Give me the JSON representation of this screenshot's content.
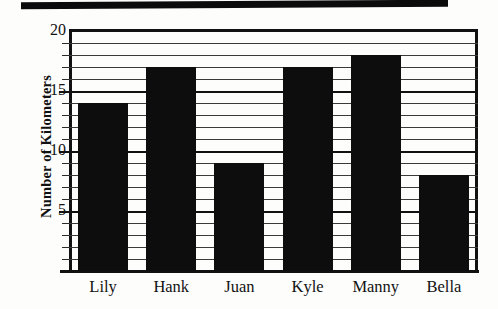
{
  "chart_data": {
    "type": "bar",
    "title": "",
    "xlabel": "",
    "ylabel": "Number of Kilometers",
    "categories": [
      "Lily",
      "Hank",
      "Juan",
      "Kyle",
      "Manny",
      "Bella"
    ],
    "values": [
      14,
      17,
      9,
      17,
      18,
      8
    ],
    "ylim": [
      0,
      20
    ],
    "ytick_labels": [
      "5",
      "10",
      "15",
      "20"
    ],
    "ytick_values": [
      5,
      10,
      15,
      20
    ],
    "grid": true,
    "grid_interval": 1,
    "legend": "none",
    "bar_color": "#0d0d0d",
    "axis_color": "#111111",
    "grid_color": "#3a3a3a",
    "background_color": "#ffffff"
  },
  "artifacts": {
    "scan_band_label": "scan-edge-band"
  }
}
